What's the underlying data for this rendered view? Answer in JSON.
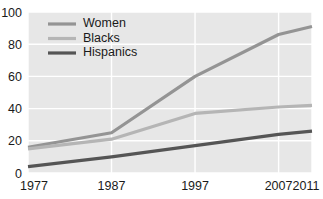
{
  "chart_data": {
    "type": "line",
    "title": "",
    "subtitle": "",
    "xlabel": "",
    "ylabel": "",
    "x": [
      1977,
      1987,
      1997,
      2007,
      2011
    ],
    "xlim": [
      1977,
      2011
    ],
    "ylim": [
      0,
      100
    ],
    "x_tick_labels": [
      "1977",
      "1987",
      "1997",
      "2007",
      "2011"
    ],
    "y_tick_labels": [
      "0",
      "20",
      "40",
      "60",
      "80",
      "100"
    ],
    "y_ticks": [
      0,
      20,
      40,
      60,
      80,
      100
    ],
    "grid": true,
    "grid_color": "#ffffff",
    "plot_background": "#e7e7e7",
    "legend_position": "top-left",
    "series": [
      {
        "name": "Women",
        "color": "#949494",
        "values": [
          16,
          25,
          60,
          86,
          91
        ]
      },
      {
        "name": "Blacks",
        "color": "#b5b5b5",
        "values": [
          15,
          21,
          37,
          41,
          42
        ]
      },
      {
        "name": "Hispanics",
        "color": "#555555",
        "values": [
          4,
          10,
          17,
          24,
          26
        ]
      }
    ]
  },
  "legend": {
    "items": [
      {
        "label": "Women",
        "color": "#949494"
      },
      {
        "label": "Blacks",
        "color": "#b5b5b5"
      },
      {
        "label": "Hispanics",
        "color": "#555555"
      }
    ]
  },
  "axes": {
    "y_labels": [
      "100",
      "80",
      "60",
      "40",
      "20",
      "0"
    ],
    "x_labels": [
      "1977",
      "1987",
      "1997",
      "2007",
      "2011"
    ]
  }
}
